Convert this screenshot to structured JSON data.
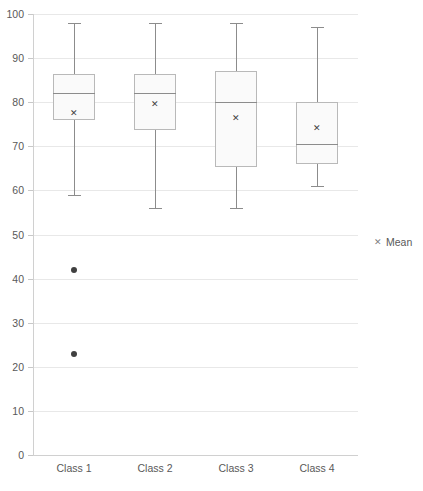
{
  "chart_data": {
    "type": "box",
    "title": "",
    "xlabel": "",
    "ylabel": "",
    "ylim": [
      0,
      100
    ],
    "ytick_step": 10,
    "yticks": [
      "0",
      "10",
      "20",
      "30",
      "40",
      "50",
      "60",
      "70",
      "80",
      "90",
      "100"
    ],
    "categories": [
      "Class 1",
      "Class 2",
      "Class 3",
      "Class 4"
    ],
    "grid": true,
    "legend": {
      "position": "right",
      "entries": [
        {
          "marker": "x-mark-icon",
          "label": "Mean"
        }
      ]
    },
    "boxes": [
      {
        "category": "Class 1",
        "whisker_low": 59,
        "q1": 76,
        "median": 82,
        "q3": 86.5,
        "whisker_high": 98,
        "mean": 77.6,
        "outliers": [
          42,
          23
        ]
      },
      {
        "category": "Class 2",
        "whisker_low": 56,
        "q1": 73.7,
        "median": 82,
        "q3": 86.5,
        "whisker_high": 98,
        "mean": 79.6,
        "outliers": []
      },
      {
        "category": "Class 3",
        "whisker_low": 56,
        "q1": 65.3,
        "median": 80,
        "q3": 87,
        "whisker_high": 98,
        "mean": 76.4,
        "outliers": []
      },
      {
        "category": "Class 4",
        "whisker_low": 61,
        "q1": 66,
        "median": 70.5,
        "q3": 80,
        "whisker_high": 97,
        "mean": 74.1,
        "outliers": []
      }
    ],
    "colors": {
      "box_fill": "#fafafa",
      "box_border": "#b9b9b9",
      "whisker": "#8c8c8c",
      "median": "#8c8c8c",
      "outlier": "#404040",
      "grid": "#e8e8e8",
      "text": "#595959"
    }
  }
}
